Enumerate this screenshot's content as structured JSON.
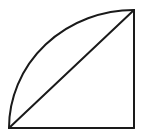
{
  "diagram": {
    "shape": "quarter-circle-sector",
    "stroke_color": "#1a1a1a",
    "background_color": "#ffffff",
    "points": {
      "center": [
        134,
        128
      ],
      "bottom_left": [
        9,
        128
      ],
      "top_right": [
        134,
        10
      ]
    },
    "radius_x": 125,
    "radius_y": 118,
    "elements": [
      {
        "type": "arc",
        "from": "bottom_left",
        "to": "top_right"
      },
      {
        "type": "line",
        "name": "chord",
        "from": "bottom_left",
        "to": "top_right"
      },
      {
        "type": "line",
        "name": "radius-vertical",
        "from": "top_right",
        "to": "center"
      },
      {
        "type": "line",
        "name": "radius-horizontal",
        "from": "center",
        "to": "bottom_left"
      }
    ],
    "labels": []
  }
}
